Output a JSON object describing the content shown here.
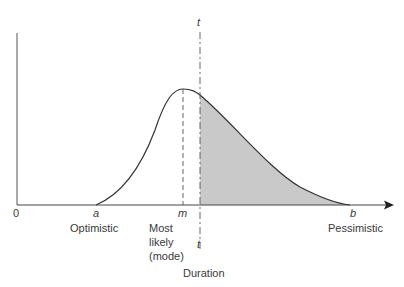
{
  "diagram": {
    "type": "probability-distribution",
    "colors": {
      "curve": "#333333",
      "shade": "#c9c9c9",
      "axis": "#444444"
    },
    "axis": {
      "origin_label": "0",
      "x_title": "Duration"
    },
    "markers": [
      {
        "symbol": "a",
        "caption": "Optimistic"
      },
      {
        "symbol": "m",
        "caption_lines": [
          "Most",
          "likely",
          "(mode)"
        ]
      },
      {
        "symbol": "t",
        "top_symbol": "t"
      },
      {
        "symbol": "b",
        "caption": "Pessimistic"
      }
    ]
  }
}
